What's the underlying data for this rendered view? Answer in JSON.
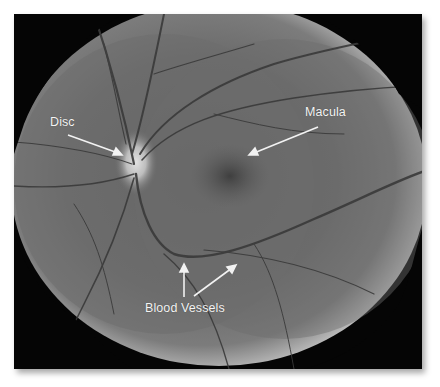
{
  "figure": {
    "labels": [
      {
        "id": "disc",
        "text": "Disc"
      },
      {
        "id": "macula",
        "text": "Macula"
      },
      {
        "id": "blood-vessels",
        "text": "Blood Vessels"
      }
    ]
  },
  "colors": {
    "background": "#ffffff",
    "frame": "#050505",
    "fundus": "#6e6e6e",
    "label_text": "#f4f4f4",
    "vessels": "#3a3a3a"
  }
}
